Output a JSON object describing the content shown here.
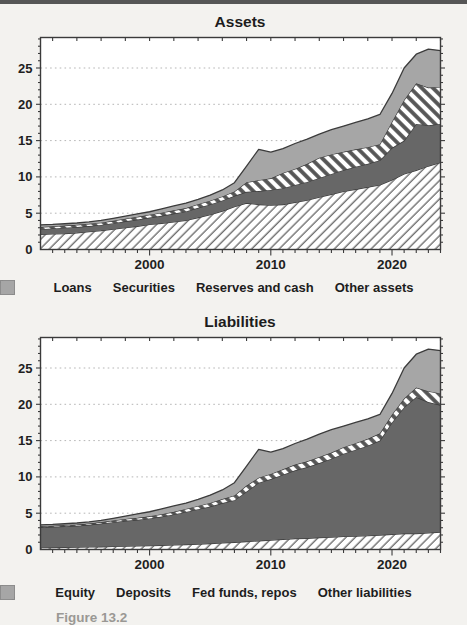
{
  "page": {
    "top_rule_color": "#565656",
    "background": "#f3f2ef"
  },
  "caption": {
    "text": "Figure 13.2"
  },
  "palette": {
    "dark_fill": "#676767",
    "gray_fill": "#a6a6a6",
    "outline": "#3b3b3b",
    "hatch_thin_line": "#6e6e6e",
    "hatch_thick_line": "#555555",
    "hatch_background": "#ffffff",
    "gridline": "#b5b5b5",
    "plot_background": "#ffffff",
    "text": "#1f1f1f"
  },
  "chart_data": [
    {
      "type": "area",
      "stacked": true,
      "title": "Assets",
      "grid": "horizontal-dotted",
      "legend_position": "bottom",
      "x": [
        1991,
        1992,
        1993,
        1994,
        1995,
        1996,
        1997,
        1998,
        1999,
        2000,
        2001,
        2002,
        2003,
        2004,
        2005,
        2006,
        2007,
        2008,
        2009,
        2010,
        2011,
        2012,
        2013,
        2014,
        2015,
        2016,
        2017,
        2018,
        2019,
        2020,
        2021,
        2022,
        2023,
        2024
      ],
      "xticks": [
        2000,
        2010,
        2020
      ],
      "yticks": [
        0,
        5,
        10,
        15,
        20,
        25
      ],
      "ylim": [
        0,
        29.2
      ],
      "series": [
        {
          "name": "Loans",
          "style": "hatch-forward",
          "values": [
            2.1,
            2.15,
            2.2,
            2.3,
            2.45,
            2.6,
            2.8,
            3.0,
            3.2,
            3.45,
            3.6,
            3.8,
            4.0,
            4.4,
            4.8,
            5.3,
            5.9,
            6.4,
            6.2,
            6.1,
            6.2,
            6.5,
            6.8,
            7.2,
            7.6,
            8.0,
            8.3,
            8.6,
            8.9,
            9.6,
            10.4,
            10.9,
            11.5,
            12.0
          ]
        },
        {
          "name": "Securities",
          "style": "solid-dark",
          "values": [
            0.7,
            0.75,
            0.8,
            0.8,
            0.78,
            0.78,
            0.82,
            0.88,
            0.92,
            0.95,
            1.05,
            1.15,
            1.25,
            1.35,
            1.4,
            1.45,
            1.5,
            1.55,
            1.85,
            2.1,
            2.25,
            2.4,
            2.5,
            2.65,
            2.8,
            2.95,
            3.1,
            3.2,
            3.4,
            4.4,
            4.6,
            6.4,
            5.6,
            5.3
          ]
        },
        {
          "name": "Reserves and cash",
          "style": "hatch-backward",
          "values": [
            0.3,
            0.3,
            0.3,
            0.3,
            0.3,
            0.32,
            0.34,
            0.36,
            0.38,
            0.4,
            0.42,
            0.44,
            0.46,
            0.5,
            0.52,
            0.55,
            0.6,
            1.3,
            1.5,
            1.6,
            2.1,
            2.2,
            2.5,
            2.8,
            2.7,
            2.5,
            2.4,
            2.3,
            2.2,
            3.6,
            5.6,
            5.6,
            5.2,
            5.1
          ]
        },
        {
          "name": "Other assets",
          "style": "solid-gray",
          "values": [
            0.3,
            0.25,
            0.25,
            0.25,
            0.27,
            0.3,
            0.34,
            0.36,
            0.4,
            0.4,
            0.53,
            0.61,
            0.69,
            0.65,
            0.78,
            0.9,
            1.2,
            2.25,
            4.25,
            3.6,
            3.35,
            3.5,
            3.4,
            3.25,
            3.4,
            3.55,
            3.7,
            3.9,
            4.1,
            3.9,
            4.4,
            4.0,
            5.3,
            5.0
          ]
        }
      ]
    },
    {
      "type": "area",
      "stacked": true,
      "title": "Liabilities",
      "grid": "horizontal-dotted",
      "legend_position": "bottom",
      "x": [
        1991,
        1992,
        1993,
        1994,
        1995,
        1996,
        1997,
        1998,
        1999,
        2000,
        2001,
        2002,
        2003,
        2004,
        2005,
        2006,
        2007,
        2008,
        2009,
        2010,
        2011,
        2012,
        2013,
        2014,
        2015,
        2016,
        2017,
        2018,
        2019,
        2020,
        2021,
        2022,
        2023,
        2024
      ],
      "xticks": [
        2000,
        2010,
        2020
      ],
      "yticks": [
        0,
        5,
        10,
        15,
        20,
        25
      ],
      "ylim": [
        0,
        29.2
      ],
      "series": [
        {
          "name": "Equity",
          "style": "hatch-forward",
          "values": [
            0.25,
            0.27,
            0.3,
            0.32,
            0.35,
            0.38,
            0.42,
            0.46,
            0.5,
            0.53,
            0.58,
            0.63,
            0.68,
            0.75,
            0.82,
            0.9,
            1.0,
            1.1,
            1.2,
            1.3,
            1.4,
            1.5,
            1.55,
            1.65,
            1.7,
            1.8,
            1.85,
            1.9,
            2.0,
            2.1,
            2.2,
            2.2,
            2.3,
            2.4
          ]
        },
        {
          "name": "Deposits",
          "style": "solid-dark",
          "values": [
            2.8,
            2.85,
            2.9,
            2.95,
            3.05,
            3.2,
            3.35,
            3.5,
            3.6,
            3.75,
            3.95,
            4.2,
            4.5,
            4.8,
            5.1,
            5.5,
            5.8,
            6.9,
            8.0,
            8.4,
            8.9,
            9.4,
            9.8,
            10.25,
            10.8,
            11.4,
            11.9,
            12.4,
            13.0,
            15.4,
            17.4,
            18.8,
            18.0,
            17.5
          ]
        },
        {
          "name": "Fed funds, repos",
          "style": "hatch-backward",
          "values": [
            0.15,
            0.15,
            0.16,
            0.17,
            0.18,
            0.2,
            0.22,
            0.25,
            0.27,
            0.3,
            0.33,
            0.36,
            0.4,
            0.45,
            0.5,
            0.55,
            0.65,
            0.8,
            0.7,
            0.7,
            0.75,
            0.8,
            0.8,
            0.85,
            0.85,
            0.9,
            0.9,
            0.95,
            1.0,
            1.1,
            1.2,
            1.3,
            1.5,
            1.6
          ]
        },
        {
          "name": "Other liabilities",
          "style": "solid-gray",
          "values": [
            0.2,
            0.18,
            0.19,
            0.21,
            0.22,
            0.22,
            0.31,
            0.39,
            0.53,
            0.62,
            0.74,
            0.81,
            0.82,
            0.9,
            1.08,
            1.25,
            1.75,
            2.7,
            3.9,
            3.0,
            2.85,
            2.9,
            3.05,
            3.15,
            3.15,
            2.9,
            2.85,
            2.75,
            2.6,
            2.9,
            4.2,
            4.6,
            5.8,
            5.9
          ]
        }
      ]
    }
  ]
}
